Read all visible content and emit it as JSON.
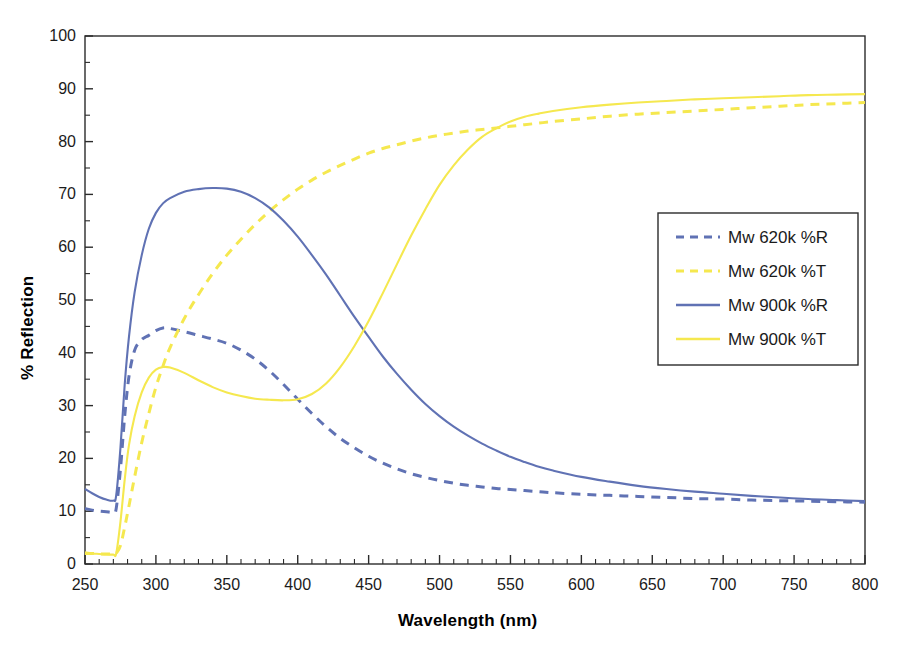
{
  "chart_data": {
    "type": "line",
    "title": "",
    "xlabel": "Wavelength (nm)",
    "ylabel": "% Reflection",
    "xlim": [
      250,
      800
    ],
    "ylim": [
      0,
      100
    ],
    "xticks": [
      250,
      300,
      350,
      400,
      450,
      500,
      550,
      600,
      650,
      700,
      750,
      800
    ],
    "yticks": [
      0,
      10,
      20,
      30,
      40,
      50,
      60,
      70,
      80,
      90,
      100
    ],
    "xtick_labels": [
      "250",
      "300",
      "350",
      "400",
      "450",
      "500",
      "550",
      "600",
      "650",
      "700",
      "750",
      "800"
    ],
    "ytick_labels": [
      "0",
      "10",
      "20",
      "30",
      "40",
      "50",
      "60",
      "70",
      "80",
      "90",
      "100"
    ],
    "x_minor_tick_step": 10,
    "y_minor_tick_step": 5,
    "grid": false,
    "legend_position": "right-upper-inside",
    "colors": {
      "blue": "#6072b4",
      "yellow": "#f5e84f",
      "axis": "#2b2b2b",
      "text": "#1b1b1b",
      "background": "#ffffff"
    },
    "x": [
      250,
      255,
      260,
      265,
      270,
      272,
      275,
      278,
      281,
      285,
      290,
      295,
      300,
      305,
      310,
      320,
      330,
      340,
      350,
      360,
      370,
      380,
      390,
      400,
      410,
      420,
      430,
      440,
      450,
      460,
      470,
      480,
      490,
      500,
      510,
      520,
      530,
      540,
      550,
      560,
      570,
      580,
      600,
      620,
      640,
      660,
      680,
      700,
      720,
      740,
      760,
      780,
      800
    ],
    "series": [
      {
        "name": "Mw 620k %R",
        "label": "Mw 620k %R",
        "color": "#6072b4",
        "style": "dashed",
        "values": [
          10.5,
          10.2,
          10.0,
          9.9,
          9.8,
          10.5,
          18.0,
          28.0,
          35.5,
          40.5,
          42.5,
          43.3,
          44.2,
          44.7,
          44.6,
          44.0,
          43.3,
          42.6,
          41.8,
          40.5,
          38.8,
          36.6,
          34.0,
          31.2,
          28.5,
          26.0,
          23.8,
          22.0,
          20.4,
          19.1,
          18.0,
          17.1,
          16.4,
          15.8,
          15.3,
          14.9,
          14.6,
          14.3,
          14.1,
          13.9,
          13.7,
          13.5,
          13.2,
          13.0,
          12.8,
          12.6,
          12.4,
          12.3,
          12.1,
          12.0,
          11.9,
          11.8,
          11.7
        ]
      },
      {
        "name": "Mw 620k %T",
        "label": "Mw 620k %T",
        "color": "#f5e84f",
        "style": "dashed",
        "values": [
          2.0,
          2.0,
          1.9,
          1.9,
          1.9,
          2.0,
          3.5,
          7.0,
          11.0,
          16.5,
          23.0,
          28.5,
          33.5,
          37.5,
          41.0,
          46.5,
          51.0,
          55.0,
          58.5,
          61.5,
          64.3,
          66.8,
          69.0,
          71.0,
          72.7,
          74.2,
          75.5,
          76.7,
          77.8,
          78.7,
          79.4,
          80.1,
          80.7,
          81.2,
          81.6,
          82.0,
          82.3,
          82.6,
          82.9,
          83.2,
          83.5,
          83.8,
          84.3,
          84.8,
          85.2,
          85.5,
          85.8,
          86.1,
          86.4,
          86.7,
          87.0,
          87.2,
          87.4
        ]
      },
      {
        "name": "Mw 900k %R",
        "label": "Mw 900k %R",
        "color": "#6072b4",
        "style": "solid",
        "values": [
          14.2,
          13.4,
          12.7,
          12.2,
          12.0,
          13.0,
          22.0,
          34.0,
          43.0,
          51.5,
          58.5,
          63.5,
          66.5,
          68.3,
          69.3,
          70.5,
          71.0,
          71.2,
          71.1,
          70.5,
          69.3,
          67.5,
          65.0,
          62.0,
          58.5,
          54.8,
          50.8,
          46.8,
          43.0,
          39.3,
          36.0,
          33.0,
          30.3,
          28.0,
          26.0,
          24.3,
          22.8,
          21.5,
          20.3,
          19.3,
          18.4,
          17.7,
          16.5,
          15.6,
          14.8,
          14.2,
          13.7,
          13.3,
          12.9,
          12.6,
          12.3,
          12.1,
          11.9
        ]
      },
      {
        "name": "Mw 900k %T",
        "label": "Mw 900k %T",
        "color": "#f5e84f",
        "style": "solid",
        "values": [
          2.2,
          2.0,
          1.9,
          1.8,
          1.8,
          2.0,
          8.0,
          16.0,
          22.5,
          28.0,
          32.5,
          35.3,
          36.8,
          37.3,
          37.2,
          36.2,
          34.8,
          33.5,
          32.5,
          31.8,
          31.3,
          31.1,
          31.0,
          31.2,
          32.2,
          34.2,
          37.3,
          41.3,
          46.0,
          51.3,
          56.8,
          62.2,
          67.2,
          71.8,
          75.5,
          78.5,
          80.9,
          82.5,
          83.8,
          84.7,
          85.3,
          85.8,
          86.5,
          87.0,
          87.4,
          87.7,
          88.0,
          88.2,
          88.4,
          88.6,
          88.8,
          88.9,
          89.0
        ]
      }
    ]
  }
}
